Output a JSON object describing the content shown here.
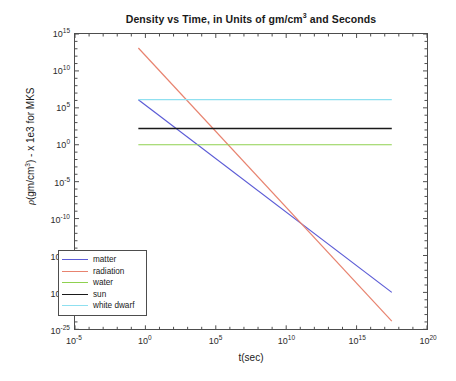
{
  "chart_data": {
    "type": "line",
    "title": "Density vs Time, in Units of gm/cm3 and Seconds",
    "title_html": "Density vs Time, in Units of gm/cm<sup>3</sup> and Seconds",
    "xlabel": "t(sec)",
    "ylabel": "ρ(gm/cm3) - x 1e3 for MKS",
    "ylabel_html": "<i>ρ</i>(gm/cm<sup>3</sup>) - x 1e3 for MKS",
    "xscale": "log",
    "yscale": "log",
    "xlim": [
      1e-05,
      1e+20
    ],
    "ylim": [
      1e-25,
      1000000000000000.0
    ],
    "xlim_exp": [
      -5,
      20
    ],
    "ylim_exp": [
      -25,
      15
    ],
    "grid": false,
    "legend_position": "lower left",
    "xticks": [
      {
        "exp": -5,
        "label": "10",
        "sup": "-5"
      },
      {
        "exp": 0,
        "label": "10",
        "sup": "0"
      },
      {
        "exp": 5,
        "label": "10",
        "sup": "5"
      },
      {
        "exp": 10,
        "label": "10",
        "sup": "10"
      },
      {
        "exp": 15,
        "label": "10",
        "sup": "15"
      },
      {
        "exp": 20,
        "label": "10",
        "sup": "20"
      }
    ],
    "yticks": [
      {
        "exp": 15,
        "label": "10",
        "sup": "15"
      },
      {
        "exp": 10,
        "label": "10",
        "sup": "10"
      },
      {
        "exp": 5,
        "label": "10",
        "sup": "5"
      },
      {
        "exp": 0,
        "label": "10",
        "sup": "0"
      },
      {
        "exp": -5,
        "label": "10",
        "sup": "-5"
      },
      {
        "exp": -10,
        "label": "10",
        "sup": "-10"
      },
      {
        "exp": -15,
        "label": "10",
        "sup": "-15"
      },
      {
        "exp": -20,
        "label": "10",
        "sup": "-20"
      },
      {
        "exp": -25,
        "label": "10",
        "sup": "-25"
      }
    ],
    "series": [
      {
        "name": "matter",
        "color": "#5b5bd6",
        "style": "solid",
        "width": 1.2,
        "kind": "diagonal",
        "points_exp": [
          [
            -0.5,
            6.1
          ],
          [
            17.5,
            -20.0
          ]
        ],
        "slope_decades": -1.45
      },
      {
        "name": "radiation",
        "color": "#e8836f",
        "style": "solid",
        "width": 1.2,
        "kind": "diagonal",
        "points_exp": [
          [
            -0.5,
            13.1
          ],
          [
            17.5,
            -23.9
          ]
        ],
        "slope_decades": -2.06
      },
      {
        "name": "water",
        "color": "#8fd14f",
        "style": "solid",
        "width": 1.2,
        "kind": "horizontal",
        "points_exp": [
          [
            -0.5,
            0.0
          ],
          [
            17.5,
            0.0
          ]
        ],
        "value_exp": 0.0
      },
      {
        "name": "sun",
        "color": "#1a1a1a",
        "style": "solid",
        "width": 1.5,
        "kind": "horizontal",
        "points_exp": [
          [
            -0.5,
            2.2
          ],
          [
            17.5,
            2.2
          ]
        ],
        "value_exp": 2.2
      },
      {
        "name": "white dwarf",
        "color": "#8fe0f0",
        "style": "solid",
        "width": 1.2,
        "kind": "horizontal",
        "points_exp": [
          [
            -0.5,
            6.1
          ],
          [
            17.5,
            6.1
          ]
        ],
        "value_exp": 6.1
      }
    ],
    "legend_entries": [
      "matter",
      "radiation",
      "water",
      "sun",
      "white dwarf"
    ]
  }
}
